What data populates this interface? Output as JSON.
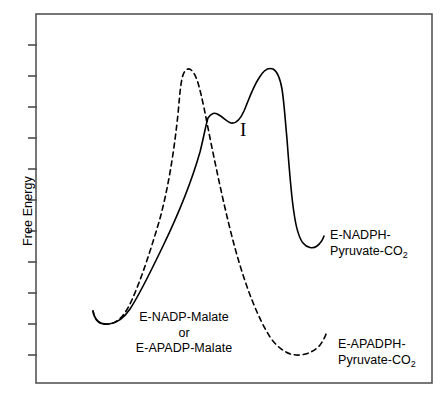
{
  "figure": {
    "type": "free-energy-reaction-coordinate-diagram",
    "axis": {
      "y_label": "Free Energy",
      "y_tick_count": 12,
      "x_label": "",
      "x_ticks": []
    },
    "frame": {
      "left": 36,
      "top": 14,
      "right": 432,
      "bottom": 383,
      "border_color": "#555555"
    }
  },
  "labels": {
    "reactants_line1": "E-NADP-Malate",
    "reactants_line2": "or",
    "reactants_line3": "E-APADP-Malate",
    "intermediate": "I",
    "nadph_product_line1": "E-NADPH-",
    "nadph_product_line2_pre": "Pyruvate-CO",
    "nadph_product_line2_sub": "2",
    "apadph_product_line1": "E-APADPH-",
    "apadph_product_line2_pre": "Pyruvate-CO",
    "apadph_product_line2_sub": "2"
  },
  "chart_data": {
    "type": "line",
    "title": "",
    "xlabel": "Reaction Coordinate",
    "ylabel": "Free Energy",
    "grid": false,
    "legend": "none",
    "xlim": [
      36,
      432
    ],
    "ylim": [
      383,
      14
    ],
    "axis_note": "Qualitative diagram; no numeric tick values are printed on either axis.",
    "series": [
      {
        "name": "E-NADP-Malate pathway (solid)",
        "style": "solid",
        "color": "#000000",
        "width": 1.6,
        "annotation": "Two-barrier profile via intermediate I leading to E-NADPH-Pyruvate-CO2",
        "features": [
          {
            "label": "reactant well",
            "x": 107,
            "y": 319
          },
          {
            "label": "first transition state",
            "x": 207,
            "y": 117
          },
          {
            "label": "intermediate I well",
            "x": 233,
            "y": 124
          },
          {
            "label": "second transition state",
            "x": 262,
            "y": 68
          },
          {
            "label": "product well",
            "x": 310,
            "y": 243
          }
        ],
        "path": "M 93 311 C 95 322 101 325 109 324 C 118 323 124 318 130 309 C 140 294 150 273 163 246 C 178 215 192 180 200 152 C 204 136 206 124 208 118 C 211 113 215 112 219 115 C 224 118 227 122 231 123 C 236 124 240 120 244 111 C 249 99 253 87 259 78 C 263 71 268 67 273 69 C 277 71 280 78 282 89 C 284 101 285 118 287 139 C 289 166 291 194 294 213 C 296 227 299 238 303 243 C 307 248 313 249 317 246 C 321 243 323 239 324 236"
      },
      {
        "name": "E-APADP-Malate pathway (dashed)",
        "style": "dashed",
        "color": "#000000",
        "width": 1.6,
        "dash_pattern": "5,4",
        "annotation": "Single-barrier profile leading to E-APADPH-Pyruvate-CO2",
        "features": [
          {
            "label": "reactant well",
            "x": 107,
            "y": 319
          },
          {
            "label": "transition state",
            "x": 185,
            "y": 70
          },
          {
            "label": "product well",
            "x": 314,
            "y": 351
          }
        ],
        "path": "M 93 311 C 95 322 101 325 109 324 C 117 323 123 317 129 306 C 138 288 148 259 159 222 C 168 190 174 152 178 114 C 180 92 181 76 185 71 C 189 66 194 70 198 83 C 202 96 206 118 211 143 C 218 177 226 215 235 248 C 246 288 258 318 270 337 C 279 350 290 356 300 355 C 309 354 316 350 320 345 C 323 341 325 337 326 334"
      }
    ]
  }
}
